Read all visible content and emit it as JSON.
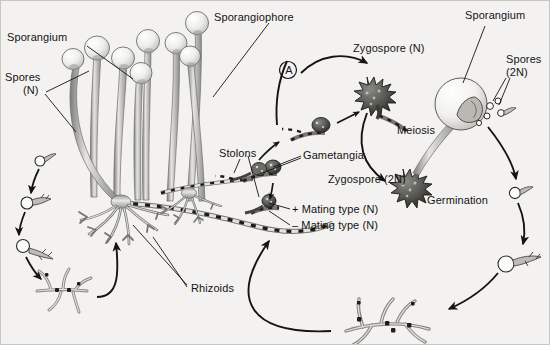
{
  "figure": {
    "background_color": "#f3f2f0",
    "ink_color": "#141414",
    "border_color": "#c9c7c3"
  },
  "labels": {
    "sporangium_left": "Sporangium",
    "spores_n_line1": "Spores",
    "spores_n_line2": "(N)",
    "sporangiophore": "Sporangiophore",
    "stolons": "Stolons",
    "rhizoids": "Rhizoids",
    "gametangia": "Gametangia",
    "stage_a": "A",
    "zygospore_n": "Zygospore (N)",
    "zygospore_2n": "Zygospore (2N)",
    "meiosis": "Meiosis",
    "plus_mating_type": "+ Mating type (N)",
    "minus_mating_type": "– Mating type (N)",
    "sporangium_right": "Sporangium",
    "spores_2n_line1": "Spores",
    "spores_2n_line2": "(2N)",
    "germination": "Germination"
  }
}
